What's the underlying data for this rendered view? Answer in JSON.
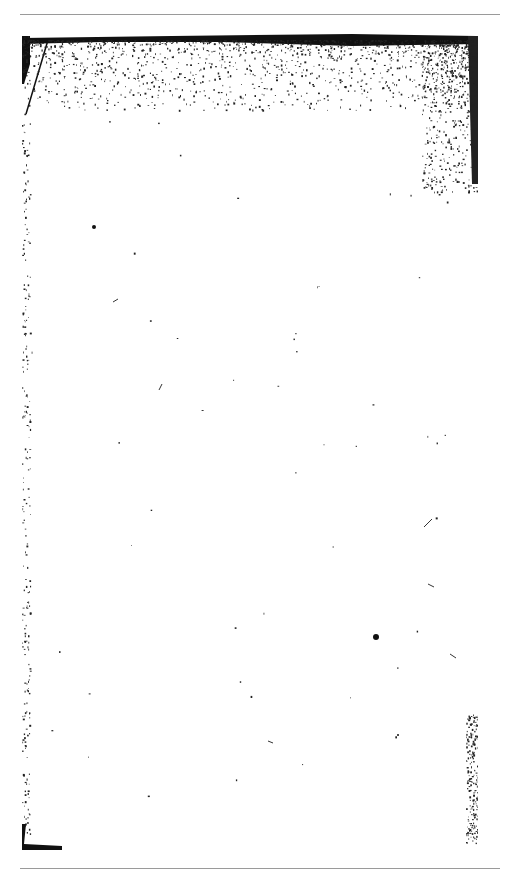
{
  "document": {
    "type": "scanned-blank-page",
    "text_content": "",
    "colors": {
      "background": "#ffffff",
      "rule": "#9a9a9a",
      "ink": "#111111"
    }
  }
}
